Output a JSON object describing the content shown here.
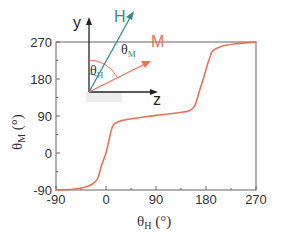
{
  "chart_data": {
    "type": "line",
    "title": "",
    "xlabel": "θH (°)",
    "ylabel": "θM (°)",
    "xlim": [
      -90,
      270
    ],
    "ylim": [
      -90,
      270
    ],
    "xticks": [
      -90,
      0,
      90,
      180,
      270
    ],
    "yticks": [
      -90,
      0,
      90,
      180,
      270
    ],
    "grid": false,
    "legend": null,
    "series": [
      {
        "name": "θM vs θH",
        "color": "#e8735a",
        "x": [
          -90,
          -60,
          -40,
          -25,
          -15,
          -8,
          0,
          6,
          12,
          20,
          40,
          70,
          100,
          130,
          150,
          160,
          168,
          175,
          185,
          192,
          205,
          230,
          270
        ],
        "y": [
          -90,
          -88,
          -84,
          -76,
          -62,
          -30,
          0,
          35,
          65,
          75,
          82,
          88,
          93,
          98,
          103,
          115,
          150,
          180,
          225,
          248,
          258,
          265,
          270
        ]
      }
    ],
    "inset": {
      "y_axis_label": "y",
      "z_axis_label": "z",
      "h_label": "H",
      "m_label": "M",
      "theta_h_label": "θ",
      "theta_h_sub": "H",
      "theta_m_label": "θ",
      "theta_m_sub": "M",
      "h_color": "#3a8a8a",
      "m_color": "#e8735a",
      "axis_color": "#222222"
    }
  },
  "axes": {
    "x_ticks": [
      "-90",
      "0",
      "90",
      "180",
      "270"
    ],
    "y_ticks": [
      "270",
      "180",
      "90",
      "0",
      "-90"
    ],
    "x_title_main": "θ",
    "x_title_sub": "H",
    "x_title_unit": " (°)",
    "y_title_main": "θ",
    "y_title_sub": "M",
    "y_title_unit": " (°)"
  }
}
